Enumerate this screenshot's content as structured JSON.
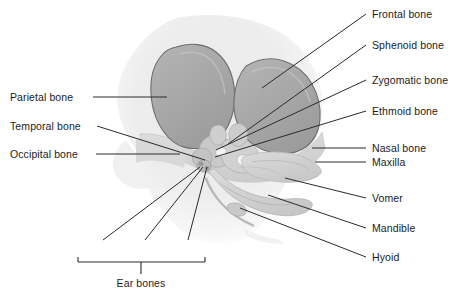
{
  "figure": {
    "background_color": "#ffffff",
    "text_color": "#1b1b1b",
    "leader_line_color": "#2a2a2a",
    "bone_fill_color": "#a9a9a9",
    "bone_stroke_color": "#6e6e6e",
    "head_outline_color": "#e9e9e9",
    "face_bone_color": "#d2d2d2"
  },
  "labels_left": [
    {
      "id": "parietal",
      "text": "Parietal bone",
      "x": 10,
      "y": 91,
      "leader": {
        "x1": 93,
        "y1": 97,
        "x2": 167,
        "y2": 97
      }
    },
    {
      "id": "temporal",
      "text": "Temporal bone",
      "x": 10,
      "y": 120,
      "leader": {
        "x1": 97,
        "y1": 126,
        "x2": 205,
        "y2": 160
      }
    },
    {
      "id": "occipital",
      "text": "Occipital bone",
      "x": 10,
      "y": 148,
      "leader": {
        "x1": 96,
        "y1": 154,
        "x2": 180,
        "y2": 154
      }
    }
  ],
  "labels_right": [
    {
      "id": "frontal",
      "text": "Frontal bone",
      "x": 372,
      "y": 8,
      "leader": {
        "x1": 366,
        "y1": 14,
        "x2": 262,
        "y2": 88
      }
    },
    {
      "id": "sphenoid",
      "text": "Sphenoid bone",
      "x": 372,
      "y": 39,
      "leader": {
        "x1": 366,
        "y1": 45,
        "x2": 228,
        "y2": 144
      }
    },
    {
      "id": "zygomatic",
      "text": "Zygomatic bone",
      "x": 372,
      "y": 74,
      "leader": {
        "x1": 366,
        "y1": 80,
        "x2": 216,
        "y2": 150
      }
    },
    {
      "id": "ethmoid",
      "text": "Ethmoid bone",
      "x": 372,
      "y": 105,
      "leader": {
        "x1": 366,
        "y1": 111,
        "x2": 215,
        "y2": 157
      }
    },
    {
      "id": "nasal",
      "text": "Nasal bone",
      "x": 372,
      "y": 142,
      "leader": {
        "x1": 366,
        "y1": 148,
        "x2": 312,
        "y2": 148
      }
    },
    {
      "id": "maxilla",
      "text": "Maxilla",
      "x": 372,
      "y": 156,
      "leader": {
        "x1": 366,
        "y1": 162,
        "x2": 315,
        "y2": 162
      }
    },
    {
      "id": "vomer",
      "text": "Vomer",
      "x": 372,
      "y": 192,
      "leader": {
        "x1": 366,
        "y1": 198,
        "x2": 285,
        "y2": 178
      }
    },
    {
      "id": "mandible",
      "text": "Mandible",
      "x": 372,
      "y": 222,
      "leader": {
        "x1": 366,
        "y1": 228,
        "x2": 268,
        "y2": 195
      }
    },
    {
      "id": "hyoid",
      "text": "Hyoid",
      "x": 372,
      "y": 251,
      "leader": {
        "x1": 366,
        "y1": 257,
        "x2": 240,
        "y2": 208
      }
    }
  ],
  "ear_bones": {
    "group_label": "Ear bones",
    "group_label_x": 141,
    "group_label_y": 277,
    "bracket": {
      "left": 78,
      "right": 205,
      "y": 262,
      "tick_height": 5,
      "stem_x": 141,
      "stem_bottom": 274
    },
    "items": [
      {
        "id": "stapes",
        "text": "Stapes",
        "x": 103,
        "y": 243,
        "leader": {
          "x1": 103,
          "y1": 240,
          "x2": 200,
          "y2": 167
        }
      },
      {
        "id": "incus",
        "text": "Incus",
        "x": 145,
        "y": 243,
        "leader": {
          "x1": 145,
          "y1": 240,
          "x2": 203,
          "y2": 167
        }
      },
      {
        "id": "malleus",
        "text": "Malleus",
        "x": 188,
        "y": 243,
        "leader": {
          "x1": 188,
          "y1": 240,
          "x2": 207,
          "y2": 167
        }
      }
    ]
  }
}
